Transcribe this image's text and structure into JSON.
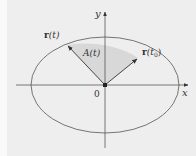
{
  "diagram": {
    "colors": {
      "background": "#eeeeee",
      "shaded_region": "#d8d8d8",
      "stroke": "#444444",
      "text": "#333333"
    },
    "axes": {
      "x_label": "x",
      "y_label": "y",
      "origin_label": "0"
    },
    "ellipse": {
      "center": [
        105,
        85
      ],
      "rx": 74,
      "ry": 48
    },
    "vectors": [
      {
        "id": "r-t",
        "label_bold": "r",
        "label_rest": "(t)",
        "tip": [
          67,
          45
        ]
      },
      {
        "id": "r-t0",
        "label_bold": "r",
        "label_rest": "(t",
        "label_sub": "0",
        "label_close": ")",
        "tip": [
          138,
          58
        ]
      }
    ],
    "region": {
      "label": "A(t)"
    }
  }
}
